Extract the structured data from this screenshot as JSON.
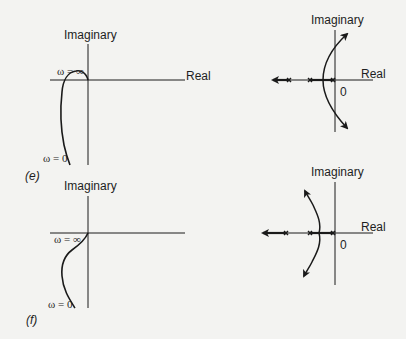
{
  "figure": {
    "panels": [
      {
        "id": "e",
        "label": "(e)",
        "nyquist": {
          "imag_label": "Imaginary",
          "real_label": "Real",
          "omega_inf_label": "ω = ∞",
          "omega_zero_label": "ω = 0"
        },
        "root_locus": {
          "imag_label": "Imaginary",
          "real_label": "Real",
          "origin_label": "0",
          "poles": 3
        }
      },
      {
        "id": "f",
        "label": "(f)",
        "nyquist": {
          "imag_label": "Imaginary",
          "real_label": "Real",
          "omega_inf_label": "ω = ∞",
          "omega_zero_label": "ω = 0"
        },
        "root_locus": {
          "imag_label": "Imaginary",
          "real_label": "Real",
          "origin_label": "0",
          "poles": 3
        }
      }
    ],
    "colors": {
      "ink": "#1a1a1a",
      "background": "#f3f3f1"
    }
  }
}
